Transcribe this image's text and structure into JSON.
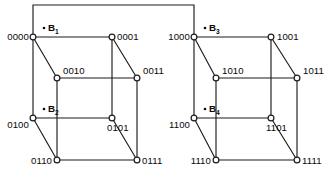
{
  "figure": {
    "name": "4-cube (tesseract) split into two 3-cubes",
    "width": 329,
    "height": 185,
    "background_color": "#ffffff",
    "line_color": "#1c1c1c",
    "node_fill_color": "#ffffff",
    "text_color": "#0a0a0a"
  },
  "nodes": [
    {
      "id": "n0000",
      "label": "0000",
      "x": 33,
      "y": 37,
      "label_x": 29,
      "label_y": 40,
      "anchor": "end"
    },
    {
      "id": "n0001",
      "label": "0001",
      "x": 112,
      "y": 37,
      "label_x": 117,
      "label_y": 40,
      "anchor": "start"
    },
    {
      "id": "n0010",
      "label": "0010",
      "x": 57,
      "y": 78,
      "label_x": 63,
      "label_y": 74,
      "anchor": "start"
    },
    {
      "id": "n0011",
      "label": "0011",
      "x": 137,
      "y": 78,
      "label_x": 143,
      "label_y": 74,
      "anchor": "start"
    },
    {
      "id": "n0100",
      "label": "0100",
      "x": 33,
      "y": 118,
      "label_x": 29,
      "label_y": 128,
      "anchor": "end"
    },
    {
      "id": "n0101",
      "label": "0101",
      "x": 112,
      "y": 118,
      "label_x": 107,
      "label_y": 131,
      "anchor": "start"
    },
    {
      "id": "n0110",
      "label": "0110",
      "x": 57,
      "y": 160,
      "label_x": 52,
      "label_y": 164,
      "anchor": "end"
    },
    {
      "id": "n0111",
      "label": "0111",
      "x": 137,
      "y": 160,
      "label_x": 142,
      "label_y": 164,
      "anchor": "start"
    },
    {
      "id": "n1000",
      "label": "1000",
      "x": 194,
      "y": 37,
      "label_x": 190,
      "label_y": 40,
      "anchor": "end"
    },
    {
      "id": "n1001",
      "label": "1001",
      "x": 271,
      "y": 37,
      "label_x": 277,
      "label_y": 40,
      "anchor": "start"
    },
    {
      "id": "n1010",
      "label": "1010",
      "x": 216,
      "y": 78,
      "label_x": 222,
      "label_y": 74,
      "anchor": "start"
    },
    {
      "id": "n1011",
      "label": "1011",
      "x": 297,
      "y": 78,
      "label_x": 303,
      "label_y": 74,
      "anchor": "start"
    },
    {
      "id": "n1100",
      "label": "1100",
      "x": 194,
      "y": 118,
      "label_x": 190,
      "label_y": 128,
      "anchor": "end"
    },
    {
      "id": "n1101",
      "label": "1101",
      "x": 271,
      "y": 118,
      "label_x": 266,
      "label_y": 131,
      "anchor": "start"
    },
    {
      "id": "n1110",
      "label": "1110",
      "x": 216,
      "y": 160,
      "label_x": 211,
      "label_y": 164,
      "anchor": "end"
    },
    {
      "id": "n1111",
      "label": "1111",
      "x": 297,
      "y": 160,
      "label_x": 302,
      "label_y": 164,
      "anchor": "start"
    }
  ],
  "edges": [
    {
      "id": "e-0000-0001",
      "from": "n0000",
      "to": "n0001"
    },
    {
      "id": "e-0000-0010",
      "from": "n0000",
      "to": "n0010"
    },
    {
      "id": "e-0000-0100",
      "from": "n0000",
      "to": "n0100"
    },
    {
      "id": "e-0001-0011",
      "from": "n0001",
      "to": "n0011"
    },
    {
      "id": "e-0001-0101",
      "from": "n0001",
      "to": "n0101"
    },
    {
      "id": "e-0010-0011",
      "from": "n0010",
      "to": "n0011"
    },
    {
      "id": "e-0010-0110",
      "from": "n0010",
      "to": "n0110"
    },
    {
      "id": "e-0011-0111",
      "from": "n0011",
      "to": "n0111"
    },
    {
      "id": "e-0100-0101",
      "from": "n0100",
      "to": "n0101"
    },
    {
      "id": "e-0100-0110",
      "from": "n0100",
      "to": "n0110"
    },
    {
      "id": "e-0101-0111",
      "from": "n0101",
      "to": "n0111"
    },
    {
      "id": "e-0110-0111",
      "from": "n0110",
      "to": "n0111"
    },
    {
      "id": "e-1000-1001",
      "from": "n1000",
      "to": "n1001"
    },
    {
      "id": "e-1000-1010",
      "from": "n1000",
      "to": "n1010"
    },
    {
      "id": "e-1000-1100",
      "from": "n1000",
      "to": "n1100"
    },
    {
      "id": "e-1001-1011",
      "from": "n1001",
      "to": "n1011"
    },
    {
      "id": "e-1001-1101",
      "from": "n1001",
      "to": "n1101"
    },
    {
      "id": "e-1010-1011",
      "from": "n1010",
      "to": "n1011"
    },
    {
      "id": "e-1010-1110",
      "from": "n1010",
      "to": "n1110"
    },
    {
      "id": "e-1011-1111",
      "from": "n1011",
      "to": "n1111"
    },
    {
      "id": "e-1100-1101",
      "from": "n1100",
      "to": "n1101"
    },
    {
      "id": "e-1100-1110",
      "from": "n1100",
      "to": "n1110"
    },
    {
      "id": "e-1101-1111",
      "from": "n1101",
      "to": "n1111"
    },
    {
      "id": "e-1110-1111",
      "from": "n1110",
      "to": "n1111"
    }
  ],
  "bracket": {
    "id": "bracket-0000-1000",
    "from": "n0000",
    "to": "n1000",
    "top_y": 5,
    "path": "M 33 37 L 33 5 L 194 5 L 194 37"
  },
  "block_labels": [
    {
      "id": "b1",
      "base": "B",
      "subscript": "1",
      "text": "B1",
      "dot_x": 44,
      "dot_y": 28,
      "x": 48,
      "y": 31
    },
    {
      "id": "b2",
      "base": "B",
      "subscript": "2",
      "text": "B2",
      "dot_x": 44,
      "dot_y": 109,
      "x": 48,
      "y": 112
    },
    {
      "id": "b3",
      "base": "B",
      "subscript": "3",
      "text": "B3",
      "dot_x": 205,
      "dot_y": 28,
      "x": 209,
      "y": 31
    },
    {
      "id": "b4",
      "base": "B",
      "subscript": "4",
      "text": "B4",
      "dot_x": 205,
      "dot_y": 109,
      "x": 209,
      "y": 112
    }
  ],
  "node_radius": 2.9,
  "block_dot_radius": 1.3
}
